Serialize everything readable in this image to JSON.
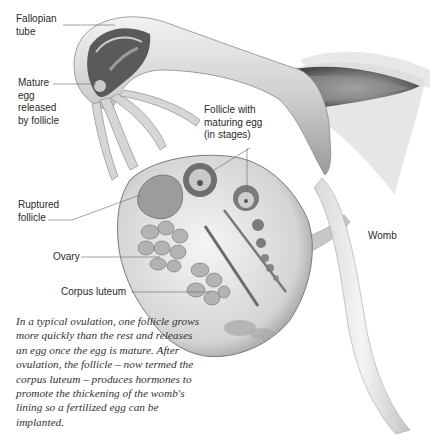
{
  "diagram": {
    "labels": {
      "fallopian_tube": "Fallopian\ntube",
      "mature_egg": "Mature\negg\nreleased\nby follicle",
      "follicle_maturing": "Follicle with\nmaturing egg\n(in stages)",
      "ruptured_follicle": "Ruptured\nfollicle",
      "ovary": "Ovary",
      "corpus_luteum": "Corpus luteum",
      "womb": "Womb"
    },
    "caption": "In a typical ovulation, one follicle grows more quickly than the rest and releases an egg once the egg is mature. After ovulation, the follicle – now termed the corpus luteum – produces hormones to promote the thickening of the womb's lining so a fertilized egg can be implanted.",
    "colors": {
      "background": "#ffffff",
      "tissue_light": "#e6e6e6",
      "tissue_mid": "#b5b5b5",
      "tissue_dark": "#555555",
      "leader_line": "#666666",
      "text": "#2a2a2a"
    }
  }
}
